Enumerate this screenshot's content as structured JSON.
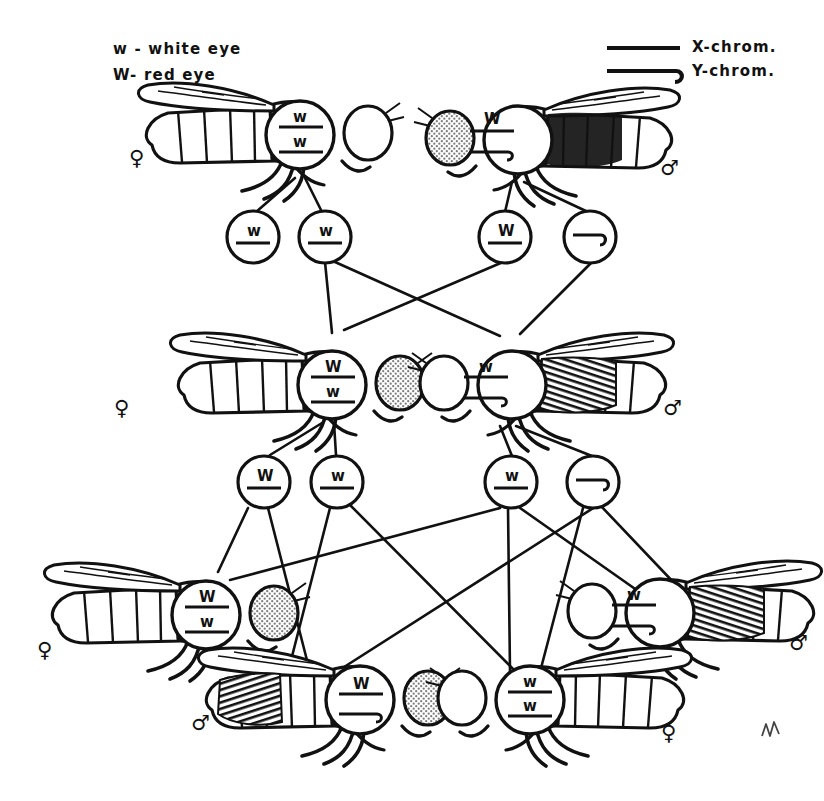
{
  "figure": {
    "signature": "M"
  },
  "legend": {
    "alleles": [
      {
        "symbol": "w",
        "dash": "-",
        "meaning": "white eye",
        "text": "w - white eye"
      },
      {
        "symbol": "W",
        "dash": "-",
        "meaning": "red eye",
        "text": "W- red eye"
      }
    ],
    "chromosomes": [
      {
        "icon": "straight-line-icon",
        "label": "X-chrom."
      },
      {
        "icon": "hooked-line-icon",
        "label": "Y-chrom."
      }
    ]
  },
  "symbols": {
    "female": "♀",
    "male": "♂",
    "dominant": "W",
    "recessive": "w"
  },
  "generations": [
    {
      "name": "P",
      "flies": [
        {
          "id": "p-female",
          "sex": "female",
          "sex_symbol": "♀",
          "facing": "right",
          "eye": "white",
          "eye_shaded": false,
          "genotype_top": "w",
          "genotype_bottom": "w",
          "top_type": "X",
          "bottom_type": "X",
          "genotype": "w/w"
        },
        {
          "id": "p-male",
          "sex": "male",
          "sex_symbol": "♂",
          "facing": "left",
          "eye": "red",
          "eye_shaded": true,
          "genotype_top": "W",
          "genotype_bottom": "Y",
          "top_type": "X",
          "bottom_type": "Y",
          "genotype": "W/Y"
        }
      ]
    },
    {
      "name": "F1",
      "flies": [
        {
          "id": "f1-female",
          "sex": "female",
          "sex_symbol": "♀",
          "facing": "right",
          "eye": "red",
          "eye_shaded": true,
          "genotype_top": "W",
          "genotype_bottom": "w",
          "top_type": "X",
          "bottom_type": "X",
          "genotype": "W/w"
        },
        {
          "id": "f1-male",
          "sex": "male",
          "sex_symbol": "♂",
          "facing": "left",
          "eye": "white",
          "eye_shaded": false,
          "genotype_top": "w",
          "genotype_bottom": "Y",
          "top_type": "X",
          "bottom_type": "Y",
          "genotype": "w/Y"
        }
      ]
    },
    {
      "name": "F2",
      "flies": [
        {
          "id": "f2-female-left",
          "sex": "female",
          "sex_symbol": "♀",
          "facing": "right",
          "eye": "red",
          "eye_shaded": true,
          "genotype_top": "W",
          "genotype_bottom": "w",
          "top_type": "X",
          "bottom_type": "X",
          "genotype": "W/w"
        },
        {
          "id": "f2-male-left",
          "sex": "male",
          "sex_symbol": "♂",
          "facing": "right",
          "eye": "red",
          "eye_shaded": true,
          "genotype_top": "W",
          "genotype_bottom": "Y",
          "top_type": "X",
          "bottom_type": "Y",
          "genotype": "W/Y"
        },
        {
          "id": "f2-female-right",
          "sex": "female",
          "sex_symbol": "♀",
          "facing": "left",
          "eye": "white",
          "eye_shaded": false,
          "genotype_top": "w",
          "genotype_bottom": "w",
          "top_type": "X",
          "bottom_type": "X",
          "genotype": "w/w"
        },
        {
          "id": "f2-male-right",
          "sex": "male",
          "sex_symbol": "♂",
          "facing": "left",
          "eye": "white",
          "eye_shaded": false,
          "genotype_top": "w",
          "genotype_bottom": "Y",
          "top_type": "X",
          "bottom_type": "Y",
          "genotype": "w/Y"
        }
      ]
    }
  ],
  "gamete_rows": [
    {
      "name": "gametes-row-1",
      "gametes": [
        {
          "id": "g1-1",
          "label": "w",
          "type": "X",
          "parent": "p-female"
        },
        {
          "id": "g1-2",
          "label": "w",
          "type": "X",
          "parent": "p-female"
        },
        {
          "id": "g1-3",
          "label": "W",
          "type": "X",
          "parent": "p-male"
        },
        {
          "id": "g1-4",
          "label": "",
          "type": "Y",
          "parent": "p-male"
        }
      ]
    },
    {
      "name": "gametes-row-2",
      "gametes": [
        {
          "id": "g2-1",
          "label": "W",
          "type": "X",
          "parent": "f1-female"
        },
        {
          "id": "g2-2",
          "label": "w",
          "type": "X",
          "parent": "f1-female"
        },
        {
          "id": "g2-3",
          "label": "w",
          "type": "X",
          "parent": "f1-male"
        },
        {
          "id": "g2-4",
          "label": "",
          "type": "Y",
          "parent": "f1-male"
        }
      ]
    }
  ],
  "colors": {
    "ink": "#111111",
    "paper": "#ffffff",
    "eye_shade": "#9a9a9a"
  }
}
